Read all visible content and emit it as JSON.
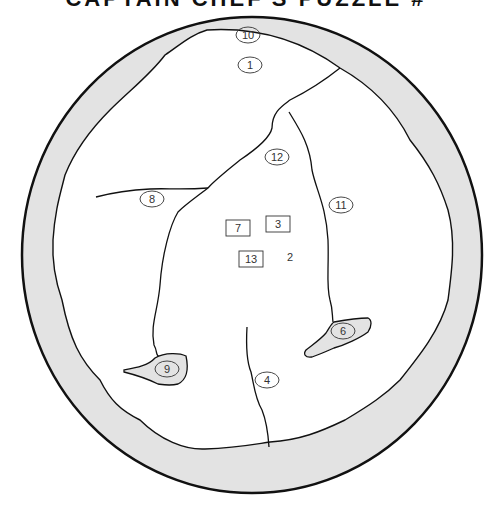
{
  "title": {
    "text": "CAPTAIN CHEF'S PUZZLE #"
  },
  "colors": {
    "ring_fill": "#e3e3e3",
    "line": "#111111",
    "label": "#333333",
    "region_fill": "#ffffff"
  },
  "labels": {
    "circled": [
      {
        "id": "10",
        "x": 248,
        "y": 35
      },
      {
        "id": "1",
        "x": 250,
        "y": 65
      },
      {
        "id": "12",
        "x": 277,
        "y": 157
      },
      {
        "id": "8",
        "x": 152,
        "y": 199
      },
      {
        "id": "11",
        "x": 341,
        "y": 205
      },
      {
        "id": "6",
        "x": 343,
        "y": 331
      },
      {
        "id": "9",
        "x": 167,
        "y": 369
      },
      {
        "id": "4",
        "x": 267,
        "y": 380
      }
    ],
    "boxed": [
      {
        "id": "7",
        "x": 238,
        "y": 228
      },
      {
        "id": "3",
        "x": 278,
        "y": 224
      },
      {
        "id": "13",
        "x": 251,
        "y": 259
      }
    ],
    "plain": [
      {
        "id": "2",
        "x": 290,
        "y": 257
      }
    ]
  }
}
